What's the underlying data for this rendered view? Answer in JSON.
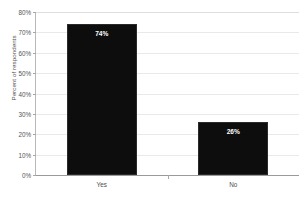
{
  "chart_data": {
    "type": "bar",
    "title": "",
    "xlabel": "",
    "ylabel": "Percent of respondents",
    "categories": [
      "Yes",
      "No"
    ],
    "values": [
      74,
      26
    ],
    "value_labels": [
      "74%",
      "26%"
    ],
    "ylim": [
      0,
      80
    ],
    "ytick_labels": [
      "80%",
      "70%",
      "60%",
      "50%",
      "40%",
      "30%",
      "20%",
      "10%",
      "0%"
    ],
    "ytick_values": [
      80,
      70,
      60,
      50,
      40,
      30,
      20,
      10,
      0
    ],
    "grid": true,
    "legend": false,
    "bar_color": "#0d0d0d",
    "gridline_color": "#e9e9e9",
    "axis_color": "#9a9a9a",
    "label_color": "#4d4d4d",
    "value_label_color": "#ffffff"
  }
}
